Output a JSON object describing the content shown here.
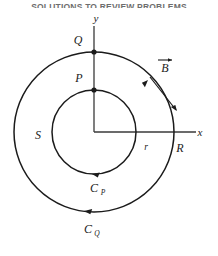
{
  "page": {
    "header_text": "SOLUTIONS TO REVIEW PROBLEMS",
    "background_color": "#ffffff",
    "ink_color": "#1b1b1b"
  },
  "figure": {
    "center": {
      "x": 94,
      "y": 132
    },
    "axes": {
      "y_label": "y",
      "x_label": "x",
      "y_axis_top": 24,
      "x_axis_right": 196
    },
    "circles": [
      {
        "name": "outer-circle",
        "radius": 80,
        "radius_label": "R",
        "contour_label": "C_Q"
      },
      {
        "name": "inner-circle",
        "radius": 42,
        "radius_label": "r",
        "contour_label": "C_P"
      }
    ],
    "points": [
      {
        "name": "point-Q",
        "label": "Q",
        "x": 94,
        "y": 52,
        "on": "outer-circle"
      },
      {
        "name": "point-P",
        "label": "P",
        "x": 94,
        "y": 90,
        "on": "inner-circle"
      }
    ],
    "labels": {
      "Q": "Q",
      "P": "P",
      "S": "S",
      "r": "r",
      "R": "R",
      "B": "B",
      "C_P_base": "C",
      "C_P_sub": "P",
      "C_Q_base": "C",
      "C_Q_sub": "Q",
      "x": "x",
      "y": "y"
    },
    "field_vector": {
      "name": "magnetic-field-vector",
      "label": "B",
      "has_overarrow": true
    },
    "orientation": "counterclockwise"
  }
}
